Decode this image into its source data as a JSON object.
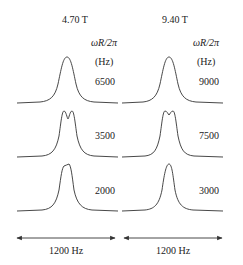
{
  "figure": {
    "columns": [
      {
        "field_label": "4.70 T",
        "rate_header": "ωR/2π",
        "rate_header_sub": "R",
        "rate_unit": "(Hz)",
        "spectra": [
          {
            "spinning_rate": "6500",
            "shape": "single"
          },
          {
            "spinning_rate": "3500",
            "shape": "doublet"
          },
          {
            "spinning_rate": "2000",
            "shape": "shoulder"
          }
        ],
        "scale_label": "1200 Hz"
      },
      {
        "field_label": "9.40 T",
        "rate_header": "ωR/2π",
        "rate_header_sub": "R",
        "rate_unit": "(Hz)",
        "spectra": [
          {
            "spinning_rate": "9000",
            "shape": "single"
          },
          {
            "spinning_rate": "7500",
            "shape": "doublet"
          },
          {
            "spinning_rate": "3000",
            "shape": "single"
          }
        ],
        "scale_label": "1200 Hz"
      }
    ]
  },
  "colors": {
    "line": "#333333",
    "text": "#222222",
    "background": "#ffffff"
  }
}
